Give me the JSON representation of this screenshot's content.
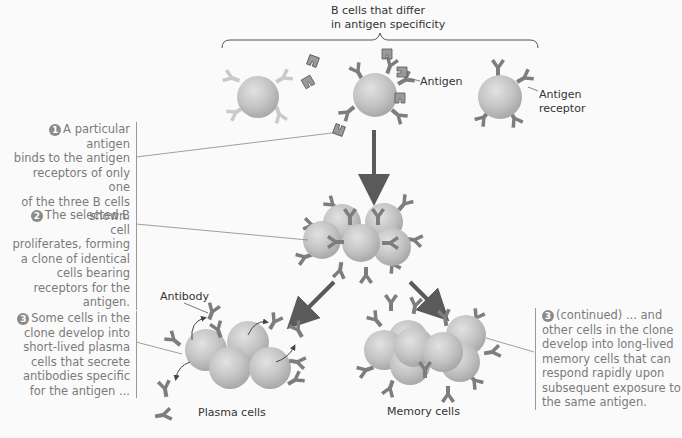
{
  "labels": {
    "top_brace": [
      "B cells that differ",
      "in antigen specificity"
    ],
    "antigen": "Antigen",
    "antigen_receptor": [
      "Antigen",
      "receptor"
    ],
    "antibody": "Antibody",
    "plasma_cells": "Plasma cells",
    "memory_cells": "Memory cells"
  },
  "steps": [
    {
      "number": "1",
      "lines": [
        "A particular antigen",
        "binds to the antigen",
        "receptors of only one",
        "of the three B cells",
        "shown."
      ]
    },
    {
      "number": "2",
      "lines": [
        "The selected B cell",
        "proliferates, forming",
        "a clone of identical",
        "cells bearing",
        "receptors for the",
        "antigen."
      ]
    },
    {
      "number": "3",
      "lines": [
        "Some cells in the",
        "clone develop into",
        "short-lived plasma",
        "cells that secrete",
        "antibodies specific",
        "for the antigen ..."
      ]
    },
    {
      "number": "3",
      "lines": [
        "(continued) ... and",
        "other cells in the clone",
        "develop into long-lived",
        "memory cells that can",
        "respond rapidly upon",
        "subsequent exposure to",
        "the same antigen."
      ]
    }
  ],
  "colors": {
    "cell_fill": "#c4c4c4",
    "cell_edge": "#a8a8a8",
    "receptor": "#7d7d7d",
    "receptor_faded": "#c8c8c8",
    "arrow": "#5a5a5a",
    "text": "#333333",
    "step_text": "#7a7a7a"
  }
}
